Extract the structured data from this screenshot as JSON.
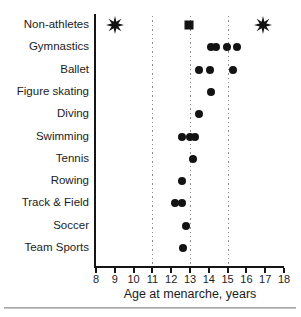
{
  "chart_data": {
    "type": "scatter",
    "subtype": "horizontal-dot-plot",
    "title": "",
    "xlabel": "Age at menarche, years",
    "ylabel": "",
    "xlim": [
      8,
      18
    ],
    "xticks": [
      8,
      9,
      10,
      11,
      12,
      13,
      14,
      15,
      16,
      17,
      18
    ],
    "gridlines_x": [
      11,
      13,
      15
    ],
    "grid_style": "dotted",
    "legend": "none",
    "categories": [
      "Non-athletes",
      "Gymnastics",
      "Ballet",
      "Figure skating",
      "Diving",
      "Swimming",
      "Tennis",
      "Rowing",
      "Track & Field",
      "Soccer",
      "Team Sports"
    ],
    "series": [
      {
        "category": "Non-athletes",
        "points": [
          {
            "x": 9.0,
            "marker": "star8"
          },
          {
            "x": 12.95,
            "marker": "square"
          },
          {
            "x": 16.9,
            "marker": "star8"
          }
        ]
      },
      {
        "category": "Gymnastics",
        "points": [
          {
            "x": 14.1,
            "marker": "dot"
          },
          {
            "x": 14.4,
            "marker": "dot"
          },
          {
            "x": 14.95,
            "marker": "dot"
          },
          {
            "x": 15.5,
            "marker": "dot"
          }
        ]
      },
      {
        "category": "Ballet",
        "points": [
          {
            "x": 13.5,
            "marker": "dot"
          },
          {
            "x": 14.05,
            "marker": "dot"
          },
          {
            "x": 15.3,
            "marker": "dot"
          }
        ]
      },
      {
        "category": "Figure skating",
        "points": [
          {
            "x": 14.1,
            "marker": "dot"
          }
        ]
      },
      {
        "category": "Diving",
        "points": [
          {
            "x": 13.5,
            "marker": "dot"
          }
        ]
      },
      {
        "category": "Swimming",
        "points": [
          {
            "x": 12.6,
            "marker": "dot"
          },
          {
            "x": 13.0,
            "marker": "dot"
          },
          {
            "x": 13.25,
            "marker": "dot"
          }
        ]
      },
      {
        "category": "Tennis",
        "points": [
          {
            "x": 13.15,
            "marker": "dot"
          }
        ]
      },
      {
        "category": "Rowing",
        "points": [
          {
            "x": 12.6,
            "marker": "dot"
          }
        ]
      },
      {
        "category": "Track & Field",
        "points": [
          {
            "x": 12.2,
            "marker": "dot"
          },
          {
            "x": 12.55,
            "marker": "dot"
          }
        ]
      },
      {
        "category": "Soccer",
        "points": [
          {
            "x": 12.8,
            "marker": "dot"
          }
        ]
      },
      {
        "category": "Team Sports",
        "points": [
          {
            "x": 12.65,
            "marker": "dot"
          }
        ]
      }
    ],
    "colors": {
      "marker": "#131313",
      "axis": "#151515",
      "grid": "#8f8f8f",
      "text": "#1c1c1c",
      "background": "#ffffff",
      "bottom_rule": "#9c9c9c"
    }
  }
}
